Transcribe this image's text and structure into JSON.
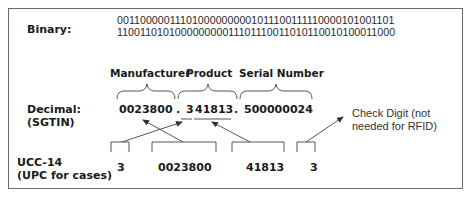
{
  "binary": {
    "label": "Binary:",
    "line1": "001100000111010000000001011100111110000101001101",
    "line2": "110011010100000000011101110011010110010100011000"
  },
  "headers": {
    "manufacturer": "Manufacturer",
    "product": "Product",
    "serial": "Serial Number"
  },
  "decimal": {
    "label_line1": "Decimal:",
    "label_line2": "(SGTIN)",
    "manufacturer": "0023800",
    "dot1": ".",
    "product_first_digit": "3",
    "product_rest": "41813",
    "dot2": ".",
    "serial": "500000024"
  },
  "check_digit_note": {
    "line1": "Check Digit (not",
    "line2": "needed for RFID)"
  },
  "ucc14": {
    "label_line1": "UCC-14",
    "label_line2": "(UPC for cases)",
    "indicator": "3",
    "manufacturer": "0023800",
    "product": "41813",
    "check_digit": "3"
  },
  "colors": {
    "border": "#6a6a6a",
    "line": "#444444",
    "text": "#1a1a1a"
  }
}
